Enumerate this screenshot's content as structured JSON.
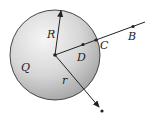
{
  "diagram": {
    "labels": {
      "R": "R",
      "D": "D",
      "C": "C",
      "B": "B",
      "Q": "Q",
      "r": "r"
    },
    "colors": {
      "sphere_light": "#f4f4f4",
      "sphere_dark": "#a8a8a8",
      "outline": "#333333",
      "line": "#222222"
    },
    "geometry": {
      "center": [
        55,
        55
      ],
      "radius": 45,
      "R_tip": [
        61,
        10
      ],
      "D": [
        83,
        44
      ],
      "C": [
        96,
        40
      ],
      "B": [
        133,
        26
      ],
      "line_end": [
        145,
        22
      ],
      "r_tip": [
        98,
        106
      ],
      "r_end": [
        102,
        111
      ]
    }
  }
}
